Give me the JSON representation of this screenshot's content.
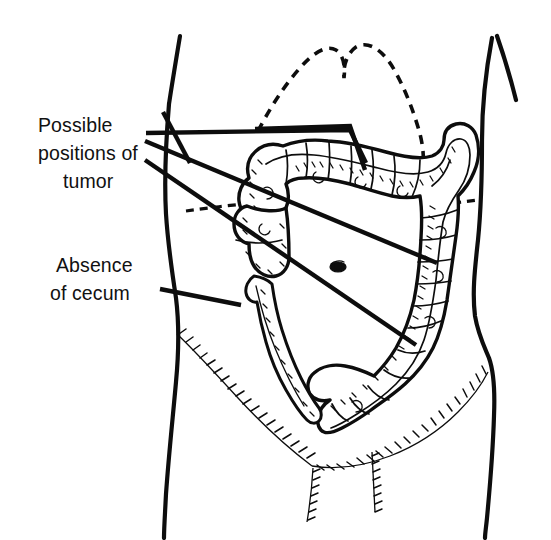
{
  "figure": {
    "background_color": "#ffffff",
    "ink_color": "#0d0d0d",
    "width": 551,
    "height": 540
  },
  "annotations": [
    {
      "id": "possible-positions-of-tumor",
      "lines": [
        "Possible",
        "positions of",
        "tumor"
      ],
      "line1": "Possible",
      "line2": "positions of",
      "line3": "tumor",
      "text_x": 38,
      "text_y": 132,
      "leader_count": 4
    },
    {
      "id": "absence-of-cecum",
      "lines": [
        "Absence",
        "of cecum"
      ],
      "line1": "Absence",
      "line2": "of cecum",
      "text_x": 56,
      "text_y": 272,
      "leader_count": 1
    }
  ],
  "anatomy": {
    "body_outline": "torso-silhouette",
    "rib_margin": "costal-margin-dashed",
    "colon": "large-intestine",
    "colon_segments": [
      "hepatic-flexure",
      "transverse-colon",
      "splenic-flexure",
      "descending-colon",
      "sigmoid-colon"
    ],
    "small_bowel": "terminal-ileum-loop",
    "navel": "umbilicus",
    "pelvis": "pelvic-brim-hatching",
    "absent_structure": "cecum"
  }
}
